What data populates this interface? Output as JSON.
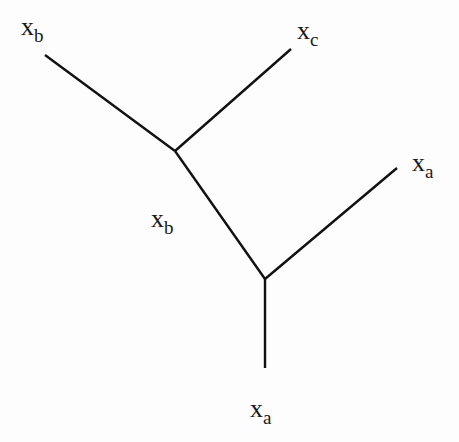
{
  "diagram": {
    "type": "tree",
    "colors": {
      "background": "#fdfdfd",
      "edge": "#111111",
      "text": "#1a1a1a"
    },
    "nodes": [
      {
        "id": "leaf-top-left",
        "x": 45,
        "y": 55
      },
      {
        "id": "leaf-top-right",
        "x": 291,
        "y": 49
      },
      {
        "id": "junction-upper",
        "x": 175,
        "y": 151
      },
      {
        "id": "leaf-right",
        "x": 397,
        "y": 168
      },
      {
        "id": "junction-lower",
        "x": 265,
        "y": 279
      },
      {
        "id": "leaf-bottom",
        "x": 265,
        "y": 368
      }
    ],
    "edges": [
      {
        "from": "leaf-top-left",
        "to": "junction-upper",
        "x1": 45,
        "y1": 55,
        "x2": 175,
        "y2": 151
      },
      {
        "from": "leaf-top-right",
        "to": "junction-upper",
        "x1": 291,
        "y1": 49,
        "x2": 175,
        "y2": 151
      },
      {
        "from": "junction-upper",
        "to": "junction-lower",
        "x1": 175,
        "y1": 151,
        "x2": 265,
        "y2": 279
      },
      {
        "from": "leaf-right",
        "to": "junction-lower",
        "x1": 397,
        "y1": 168,
        "x2": 265,
        "y2": 279
      },
      {
        "from": "junction-lower",
        "to": "leaf-bottom",
        "x1": 265,
        "y1": 279,
        "x2": 265,
        "y2": 368
      }
    ],
    "labels": [
      {
        "id": "label-top-left",
        "base": "x",
        "sub": "b",
        "x": 21,
        "y": 14
      },
      {
        "id": "label-top-right",
        "base": "x",
        "sub": "c",
        "x": 297,
        "y": 18
      },
      {
        "id": "label-right",
        "base": "x",
        "sub": "a",
        "x": 412,
        "y": 150
      },
      {
        "id": "label-middle",
        "base": "x",
        "sub": "b",
        "x": 151,
        "y": 206
      },
      {
        "id": "label-bottom",
        "base": "x",
        "sub": "a",
        "x": 250,
        "y": 396
      }
    ]
  }
}
